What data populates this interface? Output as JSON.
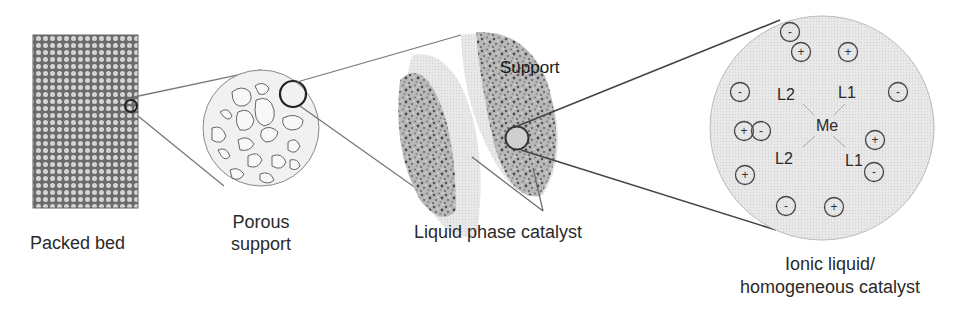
{
  "labels": {
    "packed_bed": "Packed bed",
    "porous_support_line1": "Porous",
    "porous_support_line2": "support",
    "support": "Support",
    "liquid_phase_catalyst": "Liquid phase catalyst",
    "ionic_liquid_line1": "Ionic liquid/",
    "ionic_liquid_line2": "homogeneous catalyst"
  },
  "complex": {
    "metal": "Me",
    "ligands": [
      "L2",
      "L1",
      "L2",
      "L1"
    ]
  },
  "ions": [
    {
      "sign": "-"
    },
    {
      "sign": "+"
    },
    {
      "sign": "+"
    },
    {
      "sign": "-"
    },
    {
      "sign": "-"
    },
    {
      "sign": "+"
    },
    {
      "sign": "-"
    },
    {
      "sign": "+"
    },
    {
      "sign": "-"
    },
    {
      "sign": "+"
    },
    {
      "sign": "-"
    },
    {
      "sign": "+"
    }
  ],
  "colors": {
    "line": "#555555",
    "bed_fill": "#6e6e6e",
    "bead": "#d0d0d0",
    "liquid": "#cfcfcf",
    "ionic_bg": "#e4e4e4"
  }
}
